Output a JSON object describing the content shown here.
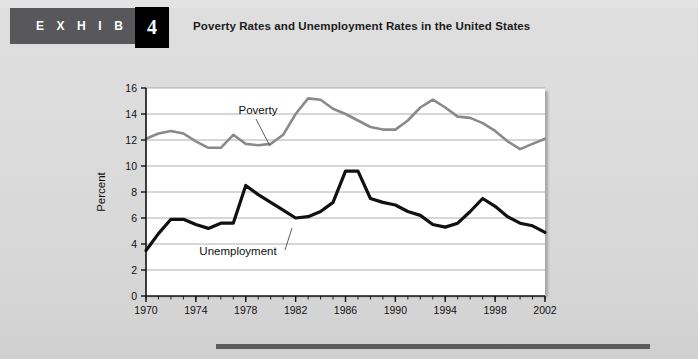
{
  "header": {
    "exhibit_label": "E X H I B I T",
    "exhibit_number": "4",
    "title": "Poverty Rates and Unemployment Rates in the United States",
    "banner_color": "#58585a",
    "number_box_color": "#000000"
  },
  "chart_data": {
    "type": "line",
    "title": "Poverty Rates and Unemployment Rates in the United States",
    "xlabel": "",
    "ylabel": "Percent",
    "xlim": [
      1970,
      2002
    ],
    "ylim": [
      0,
      16
    ],
    "grid": true,
    "legend": "inline-annotations",
    "ytick_labels": [
      "0",
      "2",
      "4",
      "6",
      "8",
      "10",
      "12",
      "14",
      "16"
    ],
    "ytick_values": [
      0,
      2,
      4,
      6,
      8,
      10,
      12,
      14,
      16
    ],
    "xtick_labels": [
      "1970",
      "1974",
      "1978",
      "1982",
      "1986",
      "1990",
      "1994",
      "1998",
      "2002"
    ],
    "xtick_values": [
      1970,
      1974,
      1978,
      1982,
      1986,
      1990,
      1994,
      1998,
      2002
    ],
    "x": [
      1970,
      1971,
      1972,
      1973,
      1974,
      1975,
      1976,
      1977,
      1978,
      1979,
      1980,
      1981,
      1982,
      1983,
      1984,
      1985,
      1986,
      1987,
      1988,
      1989,
      1990,
      1991,
      1992,
      1993,
      1994,
      1995,
      1996,
      1997,
      1998,
      1999,
      2000,
      2001,
      2002
    ],
    "series": [
      {
        "name": "Poverty",
        "color": "#8a8a8a",
        "values": [
          12.1,
          12.5,
          12.7,
          12.5,
          11.9,
          11.4,
          11.4,
          12.4,
          11.7,
          11.6,
          11.7,
          12.4,
          14.0,
          15.2,
          15.1,
          14.4,
          14.0,
          13.5,
          13.0,
          12.8,
          12.8,
          13.5,
          14.5,
          15.1,
          14.5,
          13.8,
          13.7,
          13.3,
          12.7,
          11.9,
          11.3,
          11.7,
          12.1
        ]
      },
      {
        "name": "Unemployment",
        "color": "#111111",
        "values": [
          3.5,
          4.8,
          5.9,
          5.9,
          5.5,
          5.2,
          5.6,
          5.6,
          8.5,
          7.8,
          7.2,
          6.6,
          6.0,
          6.1,
          6.5,
          7.2,
          9.6,
          9.6,
          7.5,
          7.2,
          7.0,
          6.5,
          6.2,
          5.5,
          5.3,
          5.6,
          6.5,
          7.5,
          6.9,
          6.1,
          5.6,
          5.4,
          4.9
        ]
      }
    ],
    "annotations": [
      {
        "text": "Poverty",
        "series": "Poverty"
      },
      {
        "text": "Unemployment",
        "series": "Unemployment"
      }
    ]
  }
}
